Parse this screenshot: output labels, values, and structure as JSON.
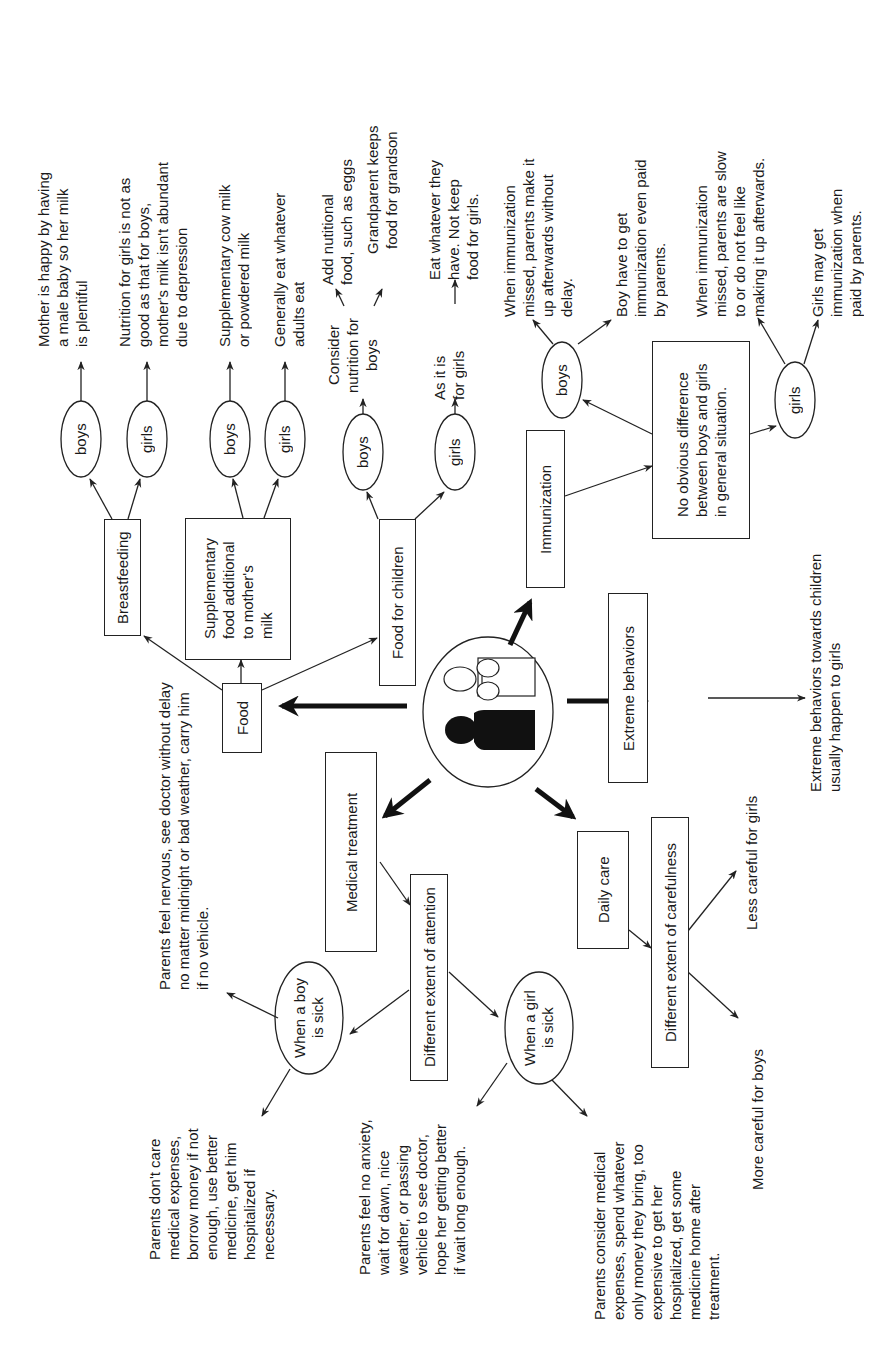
{
  "center": {
    "icon": "parent-and-child-icon"
  },
  "categories": {
    "food": "Food",
    "medical": "Medical treatment",
    "daily_care": "Daily care",
    "extreme": "Extreme behaviors",
    "immunization": "Immunization"
  },
  "food": {
    "breastfeeding": {
      "label": "Breastfeeding",
      "boys": "boys",
      "girls": "girls",
      "boys_note": "Mother is happy by having\na male baby so her milk\nis plentiful",
      "girls_note": "Nutrition for girls is not as\ngood as that for boys,\nmother's milk isn't abundant\ndue to depression"
    },
    "supplementary": {
      "label": "Supplementary\nfood additional\nto mother's\nmilk",
      "boys": "boys",
      "girls": "girls",
      "boys_note": "Supplementary cow milk\nor powdered milk",
      "girls_note": "Generally eat whatever\nadults eat"
    },
    "children": {
      "label": "Food for children",
      "boys": "boys",
      "girls": "girls",
      "boys_mid": "Consider\nnutrition for\nboys",
      "boys_note_1": "Add nutitional\nfood, such as eggs",
      "boys_note_2": "Grandparent keeps\nfood for grandson",
      "girls_mid": "As it is\nfor girls",
      "girls_note": "Eat whatever they\nhave. Not keep\nfood for girls."
    }
  },
  "immunization": {
    "general": "No obvious difference\nbetween boys and girls\nin general situation.",
    "boys": "boys",
    "girls": "girls",
    "boys_note_1": "When immunization\nmissed, parents make it\nup afterwards without\ndelay.",
    "boys_note_2": "Boy have to get\nimmunization even paid\nby parents.",
    "girls_note_1": "When immunization\nmissed, parents are slow\nto or do not feel like\nmaking it up afterwards.",
    "girls_note_2": "Girls may get\nimmunization when\npaid by parents."
  },
  "extreme": {
    "note": "Extreme behaviors towards children\nusually happen to girls"
  },
  "medical": {
    "attention": "Different extent of attention",
    "boy_sick": "When a boy\nis sick",
    "girl_sick": "When a girl\nis sick",
    "boy_note_1": "Parents feel nervous, see doctor without delay\nno matter midnight or bad weather, carry him\nif no vehicle.",
    "boy_note_2": "Parents don't care\nmedical expenses,\nborrow money if not\nenough, use better\nmedicine, get him\nhospitalized if\nnecessary.",
    "girl_note_1": "Parents feel no anxiety,\nwait for dawn, nice\nweather, or passing\nvehicle to see doctor,\nhope her getting better\nif wait long enough.",
    "girl_note_2": "Parents consider medical\nexpenses, spend whatever\nonly money they bring, too\nexpensive to get her\nhospitalized, get some\nmedicine home after\ntreatment."
  },
  "daily_care": {
    "carefulness": "Different extent of carefulness",
    "boys_note": "More careful for boys",
    "girls_note": "Less careful for girls"
  }
}
